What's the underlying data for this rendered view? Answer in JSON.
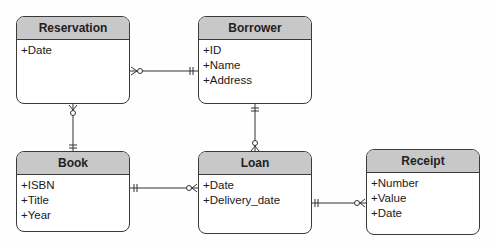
{
  "entities": {
    "reservation": {
      "name": "Reservation",
      "attributes": [
        "+Date"
      ]
    },
    "borrower": {
      "name": "Borrower",
      "attributes": [
        "+ID",
        "+Name",
        "+Address"
      ]
    },
    "book": {
      "name": "Book",
      "attributes": [
        "+ISBN",
        "+Title",
        "+Year"
      ]
    },
    "loan": {
      "name": "Loan",
      "attributes": [
        "+Date",
        "+Delivery_date"
      ]
    },
    "receipt": {
      "name": "Receipt",
      "attributes": [
        "+Number",
        "+Value",
        "+Date"
      ]
    }
  },
  "relationships": [
    {
      "from": "Reservation",
      "from_cardinality": "zero-or-many",
      "to": "Borrower",
      "to_cardinality": "one-and-only-one"
    },
    {
      "from": "Reservation",
      "from_cardinality": "zero-or-many",
      "to": "Book",
      "to_cardinality": "one-and-only-one"
    },
    {
      "from": "Borrower",
      "from_cardinality": "one-and-only-one",
      "to": "Loan",
      "to_cardinality": "zero-or-many"
    },
    {
      "from": "Book",
      "from_cardinality": "one-and-only-one",
      "to": "Loan",
      "to_cardinality": "zero-or-many"
    },
    {
      "from": "Loan",
      "from_cardinality": "one-and-only-one",
      "to": "Receipt",
      "to_cardinality": "zero-or-many"
    }
  ]
}
